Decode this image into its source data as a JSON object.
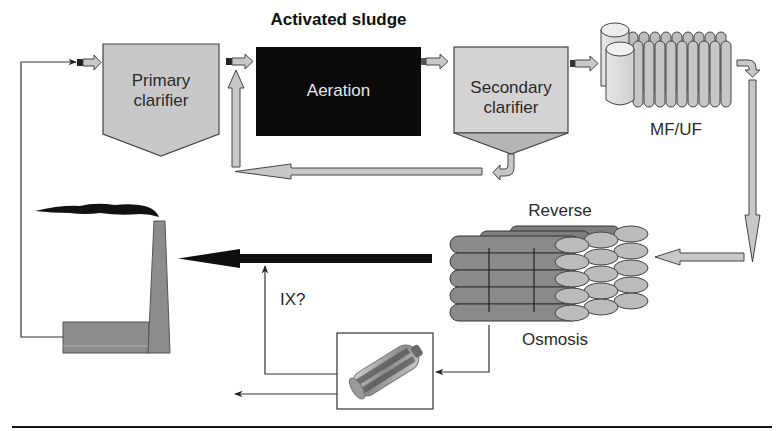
{
  "diagram": {
    "title": "Activated sludge",
    "nodes": {
      "primary_clarifier": {
        "line1": "Primary",
        "line2": "clarifier"
      },
      "aeration": {
        "label": "Aeration"
      },
      "secondary_clarifier": {
        "line1": "Secondary",
        "line2": "clarifier"
      },
      "mf_uf": {
        "label": "MF/UF"
      },
      "reverse_osmosis": {
        "top_label": "Reverse",
        "bottom_label": "Osmosis"
      },
      "ion_exchange": {
        "label": "IX?"
      },
      "factory": {
        "label": ""
      }
    },
    "flows": [
      {
        "from": "factory",
        "to": "primary_clarifier",
        "style": "thin-line"
      },
      {
        "from": "primary_clarifier",
        "to": "aeration",
        "style": "small-arrow"
      },
      {
        "from": "aeration",
        "to": "secondary_clarifier",
        "style": "small-arrow"
      },
      {
        "from": "secondary_clarifier",
        "to": "aeration",
        "style": "return-sludge-arrow"
      },
      {
        "from": "secondary_clarifier",
        "to": "mf_uf",
        "style": "small-arrow"
      },
      {
        "from": "mf_uf",
        "to": "reverse_osmosis",
        "style": "gray-arrow"
      },
      {
        "from": "reverse_osmosis",
        "to": "factory",
        "style": "black-arrow"
      },
      {
        "from": "reverse_osmosis",
        "to": "ion_exchange",
        "style": "thin-line"
      },
      {
        "from": "ion_exchange",
        "to": "black-arrow",
        "style": "thin-line"
      },
      {
        "from": "ion_exchange",
        "to": "out-left",
        "style": "thin-line"
      }
    ],
    "colors": {
      "clarifier_fill": "#c8c8c8",
      "aeration_fill": "#0a0a0a",
      "arrow_gray": "#c4c4c4",
      "ro_dark": "#8a8a8a",
      "ro_light": "#bdbdbd",
      "factory_fill": "#8c8c8c",
      "line": "#333333"
    }
  }
}
